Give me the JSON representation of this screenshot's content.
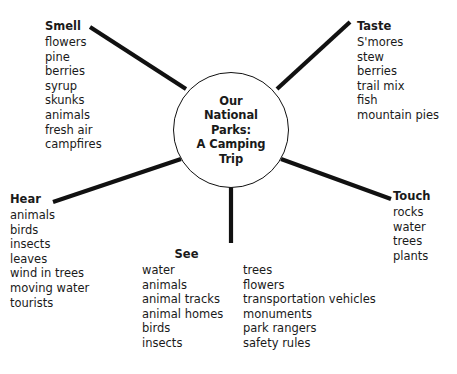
{
  "diagram": {
    "type": "sensory-web",
    "center": {
      "lines": [
        "Our",
        "National",
        "Parks:",
        "A Camping",
        "Trip"
      ]
    },
    "nodes": [
      {
        "id": "smell",
        "heading": "Smell",
        "items": [
          "flowers",
          "pine",
          "berries",
          "syrup",
          "skunks",
          "animals",
          "fresh air",
          "campfires"
        ]
      },
      {
        "id": "taste",
        "heading": "Taste",
        "items": [
          "S'mores",
          "stew",
          "berries",
          "trail mix",
          "fish",
          "mountain pies"
        ]
      },
      {
        "id": "hear",
        "heading": "Hear",
        "items": [
          "animals",
          "birds",
          "insects",
          "leaves",
          "wind in trees",
          "moving water",
          "tourists"
        ]
      },
      {
        "id": "touch",
        "heading": "Touch",
        "items": [
          "rocks",
          "water",
          "trees",
          "plants"
        ]
      },
      {
        "id": "see",
        "heading": "See",
        "column_1": [
          "water",
          "animals",
          "animal tracks",
          "animal homes",
          "birds",
          "insects"
        ],
        "column_2": [
          "trees",
          "flowers",
          "transportation vehicles",
          "monuments",
          "park rangers",
          "safety rules"
        ]
      }
    ],
    "colors": {
      "background": "#ffffff",
      "text": "#1a1a1a",
      "line": "#111111"
    }
  }
}
